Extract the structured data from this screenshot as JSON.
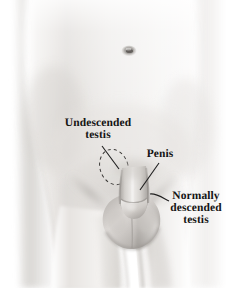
{
  "figure": {
    "style": "grayscale medical line-and-wash illustration",
    "width": 236,
    "height": 288,
    "background_color": "#ffffff",
    "skin_light": "#f2f0ee",
    "skin_mid": "#dbd8d5",
    "skin_shadow": "#b9b5b1",
    "skin_deep_shadow": "#9b9793",
    "ink_color": "#141414",
    "leader_color": "#1e1e1e",
    "dashed_outline_color": "#3a3a3a"
  },
  "labels": {
    "undescended_testis": {
      "line1": "Undescended",
      "line2": "testis",
      "points_to": "dashed-oval-inguinal-region"
    },
    "penis": {
      "line1": "Penis",
      "points_to": "penis-shaft"
    },
    "normally_descended_testis": {
      "line1": "Normally",
      "line2": "descended",
      "line3": "testis",
      "points_to": "scrotum-right-side"
    }
  },
  "anatomy": {
    "navel": "navel",
    "penis": "penis",
    "glans": "glans",
    "scrotum": "scrotum",
    "left_thigh": "left thigh",
    "right_thigh": "right thigh",
    "inguinal_marker": "dashed oval marking undescended testis location"
  }
}
